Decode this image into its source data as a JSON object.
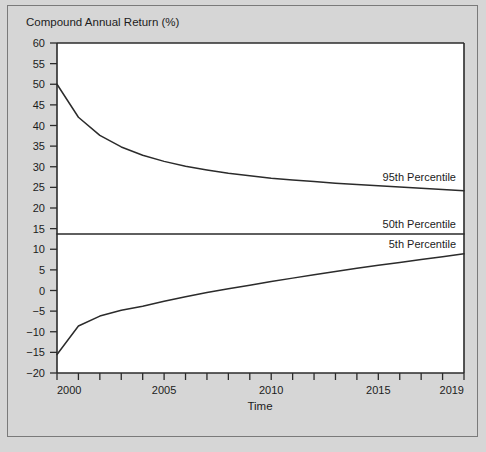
{
  "figure": {
    "background_color": "#d6d6d6",
    "plot_background_color": "#ffffff",
    "line_color": "#2b2b2b",
    "frame_color": "#7a7a7a"
  },
  "chart_data": {
    "type": "line",
    "title": "",
    "ylabel": "Compound Annual Return (%)",
    "xlabel": "Time",
    "grid": false,
    "legend": "inline-right-labels",
    "xlim": [
      2000,
      2019
    ],
    "ylim": [
      -20,
      60
    ],
    "ytick_step": 5,
    "xtick_step": 1,
    "x": [
      2000,
      2001,
      2002,
      2003,
      2004,
      2005,
      2006,
      2007,
      2008,
      2009,
      2010,
      2011,
      2012,
      2013,
      2014,
      2015,
      2016,
      2017,
      2018,
      2019
    ],
    "xtick_labels": [
      "2000",
      "2005",
      "2010",
      "2015",
      "2019"
    ],
    "xtick_label_values": [
      2000,
      2005,
      2010,
      2015,
      2019
    ],
    "ytick_labels": [
      "60",
      "55",
      "50",
      "45",
      "40",
      "35",
      "30",
      "25",
      "20",
      "15",
      "10",
      "5",
      "0",
      "-5",
      "-10",
      "-15",
      "-20"
    ],
    "ytick_values": [
      60,
      55,
      50,
      45,
      40,
      35,
      30,
      25,
      20,
      15,
      10,
      5,
      0,
      -5,
      -10,
      -15,
      -20
    ],
    "series": [
      {
        "name": "95th Percentile",
        "label": "95th Percentile",
        "values": [
          50.0,
          42.0,
          37.6,
          34.8,
          32.8,
          31.3,
          30.1,
          29.2,
          28.4,
          27.8,
          27.2,
          26.8,
          26.4,
          26.0,
          25.7,
          25.4,
          25.1,
          24.8,
          24.5,
          24.2
        ]
      },
      {
        "name": "50th Percentile",
        "label": "50th Percentile",
        "values": [
          13.7,
          13.7,
          13.7,
          13.7,
          13.7,
          13.7,
          13.7,
          13.7,
          13.7,
          13.7,
          13.7,
          13.7,
          13.7,
          13.7,
          13.7,
          13.7,
          13.7,
          13.7,
          13.7,
          13.7
        ]
      },
      {
        "name": "5th Percentile",
        "label": "5th Percentile",
        "values": [
          -15.5,
          -8.6,
          -6.2,
          -4.8,
          -3.8,
          -2.6,
          -1.5,
          -0.5,
          0.4,
          1.3,
          2.2,
          3.0,
          3.8,
          4.6,
          5.4,
          6.1,
          6.8,
          7.5,
          8.2,
          8.9
        ]
      }
    ]
  }
}
